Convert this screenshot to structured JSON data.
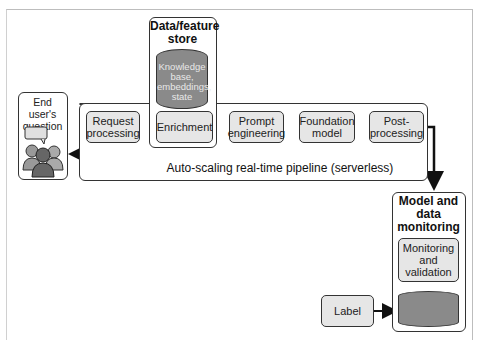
{
  "diagram": {
    "data_store": {
      "title_line1": "Data/feature",
      "title_line2": "store",
      "db_label": [
        "Knowledge",
        "base,",
        "embeddings,",
        "state"
      ]
    },
    "end_user": {
      "line1": "End user's",
      "line2": "question"
    },
    "pipeline": {
      "steps": [
        {
          "line1": "Request",
          "line2": "processing"
        },
        {
          "line1": "Enrichment",
          "line2": ""
        },
        {
          "line1": "Prompt",
          "line2": "engineering"
        },
        {
          "line1": "Foundation",
          "line2": "model"
        },
        {
          "line1": "Post-",
          "line2": "processing"
        }
      ],
      "caption": "Auto-scaling real-time pipeline (serverless)"
    },
    "monitoring": {
      "title": [
        "Model and",
        "data",
        "monitoring"
      ],
      "box": [
        "Monitoring",
        "and",
        "validation"
      ]
    },
    "label_box": "Label",
    "colors": {
      "box_fill": "#e6e6e6",
      "db_fill": "#8a8a8a",
      "stroke": "#333333"
    }
  }
}
